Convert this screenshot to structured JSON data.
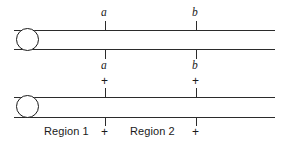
{
  "figure": {
    "ink_color": "#2b2b2b",
    "background_color": "#ffffff"
  },
  "markers": {
    "a": "a",
    "b": "b",
    "plus": "+"
  },
  "top_labels": {
    "a": "a",
    "b": "b"
  },
  "mid_labels": {
    "a": "a",
    "b": "b",
    "plus_a": "+",
    "plus_b": "+"
  },
  "bottom_labels": {
    "region1": "Region 1",
    "plus_a": "+",
    "region2": "Region 2",
    "plus_b": "+"
  }
}
